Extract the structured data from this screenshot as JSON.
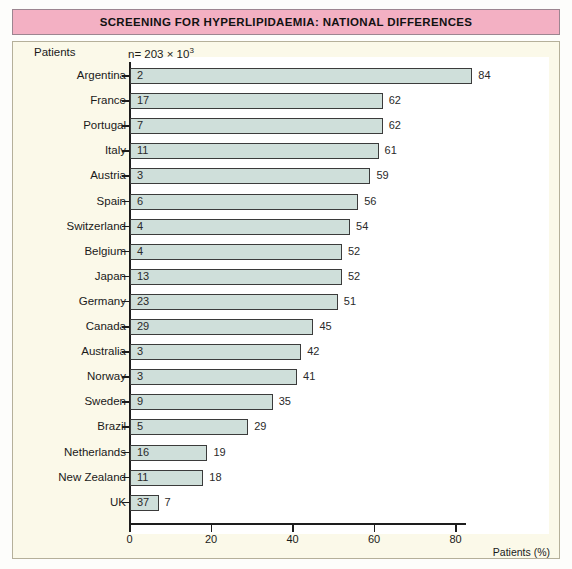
{
  "title": "SCREENING FOR HYPERLIPIDAEMIA: NATIONAL DIFFERENCES",
  "header": {
    "patients_label": "Patients",
    "sample_size": "n= 203 × 10³"
  },
  "axis": {
    "x_title": "Patients (%)",
    "x_ticks": [
      "0",
      "20",
      "40",
      "60",
      "80"
    ]
  },
  "colors": {
    "title_band": "#f3b0c3",
    "panel_bg": "#fbf9e9",
    "plot_bg": "#ffffff",
    "bar_fill": "#cfdfda",
    "bar_border": "#3b3b3b",
    "axis": "#1d1d1d"
  },
  "chart_data": {
    "type": "bar",
    "orientation": "horizontal",
    "title": "SCREENING FOR HYPERLIPIDAEMIA: NATIONAL DIFFERENCES",
    "subtitle": "n= 203 × 10³",
    "xlabel": "Patients (%)",
    "ylabel": "Patients",
    "xlim": [
      0,
      90
    ],
    "xticks": [
      0,
      20,
      40,
      60,
      80
    ],
    "grid": false,
    "legend": false,
    "categories": [
      "Argentina",
      "France",
      "Portugal",
      "Italy",
      "Austria",
      "Spain",
      "Switzerland",
      "Belgium",
      "Japan",
      "Germany",
      "Canada",
      "Australia",
      "Norway",
      "Sweden",
      "Brazil",
      "Netherlands",
      "New Zealand",
      "UK"
    ],
    "series": [
      {
        "name": "Patients screened (%)",
        "values": [
          84,
          62,
          62,
          61,
          59,
          56,
          54,
          52,
          52,
          51,
          45,
          42,
          41,
          35,
          29,
          19,
          18,
          7
        ]
      }
    ],
    "inner_labels": {
      "name": "Value shown inside bar",
      "values": [
        2,
        17,
        7,
        11,
        3,
        6,
        4,
        4,
        13,
        23,
        29,
        3,
        3,
        9,
        5,
        16,
        11,
        37
      ]
    },
    "rows": [
      {
        "country": "Argentina",
        "inner": "2",
        "end": "84"
      },
      {
        "country": "France",
        "inner": "17",
        "end": "62"
      },
      {
        "country": "Portugal",
        "inner": "7",
        "end": "62"
      },
      {
        "country": "Italy",
        "inner": "11",
        "end": "61"
      },
      {
        "country": "Austria",
        "inner": "3",
        "end": "59"
      },
      {
        "country": "Spain",
        "inner": "6",
        "end": "56"
      },
      {
        "country": "Switzerland",
        "inner": "4",
        "end": "54"
      },
      {
        "country": "Belgium",
        "inner": "4",
        "end": "52"
      },
      {
        "country": "Japan",
        "inner": "13",
        "end": "52"
      },
      {
        "country": "Germany",
        "inner": "23",
        "end": "51"
      },
      {
        "country": "Canada",
        "inner": "29",
        "end": "45"
      },
      {
        "country": "Australia",
        "inner": "3",
        "end": "42"
      },
      {
        "country": "Norway",
        "inner": "3",
        "end": "41"
      },
      {
        "country": "Sweden",
        "inner": "9",
        "end": "35"
      },
      {
        "country": "Brazil",
        "inner": "5",
        "end": "29"
      },
      {
        "country": "Netherlands",
        "inner": "16",
        "end": "19"
      },
      {
        "country": "New Zealand",
        "inner": "11",
        "end": "18"
      },
      {
        "country": "UK",
        "inner": "37",
        "end": "7"
      }
    ]
  }
}
